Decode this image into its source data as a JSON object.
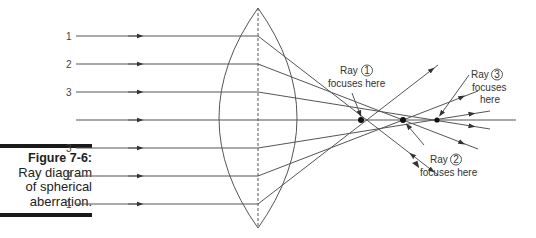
{
  "figure": {
    "number": "Figure 7-6:",
    "caption_lines": [
      "Ray diagram",
      "of spherical",
      "aberration."
    ]
  },
  "rays": {
    "upper_labels": [
      "1",
      "2",
      "3"
    ],
    "lower_labels": [
      "3",
      "2",
      "1"
    ]
  },
  "annotations": {
    "ray1": {
      "prefix": "Ray",
      "num": "1",
      "line2": "focuses here"
    },
    "ray2": {
      "prefix": "Ray",
      "num": "2",
      "line2": "focuses here"
    },
    "ray3": {
      "prefix": "Ray",
      "num": "3",
      "line2": "focuses",
      "line3": "here"
    }
  },
  "colors": {
    "line": "#555555",
    "caption_bar": "#1a1a1a"
  }
}
